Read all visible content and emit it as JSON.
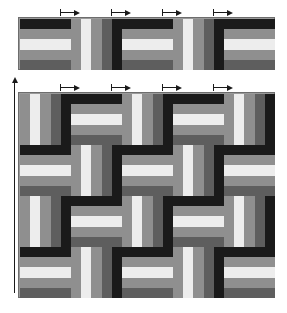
{
  "figure": {
    "background_color": "#ffffff"
  },
  "palette": {
    "black": "#1a1a1a",
    "dark_gray": "#5e5e5e",
    "medium_gray": "#8f8f8f",
    "light_gray": "#b9b9b9",
    "white": "#ededed",
    "outline": "#6d6d6d"
  },
  "block": {
    "stripe_count": 5,
    "stripe_colors": [
      "#1a1a1a",
      "#8f8f8f",
      "#ededed",
      "#8f8f8f",
      "#5e5e5e"
    ],
    "orientations": [
      "horizontal",
      "vertical"
    ],
    "size_px": 51
  },
  "top_band": {
    "label": "single row strip",
    "x": 18,
    "y": 17,
    "columns": 5,
    "rows": 1,
    "blocks": [
      {
        "orientation": "horizontal",
        "stripes": [
          "#1a1a1a",
          "#8f8f8f",
          "#ededed",
          "#8f8f8f",
          "#5e5e5e"
        ]
      },
      {
        "orientation": "vertical",
        "stripes": [
          "#8f8f8f",
          "#ededed",
          "#8f8f8f",
          "#5e5e5e",
          "#1a1a1a"
        ]
      },
      {
        "orientation": "horizontal",
        "stripes": [
          "#1a1a1a",
          "#8f8f8f",
          "#ededed",
          "#8f8f8f",
          "#5e5e5e"
        ]
      },
      {
        "orientation": "vertical",
        "stripes": [
          "#8f8f8f",
          "#ededed",
          "#8f8f8f",
          "#5e5e5e",
          "#1a1a1a"
        ]
      },
      {
        "orientation": "horizontal",
        "stripes": [
          "#1a1a1a",
          "#8f8f8f",
          "#ededed",
          "#8f8f8f",
          "#5e5e5e"
        ]
      }
    ],
    "arrows": [
      {
        "x": 60,
        "y": 9,
        "width": 20
      },
      {
        "x": 111,
        "y": 9,
        "width": 20
      },
      {
        "x": 162,
        "y": 9,
        "width": 20
      },
      {
        "x": 213,
        "y": 9,
        "width": 20
      }
    ]
  },
  "main_quilt": {
    "label": "assembled quilt top",
    "x": 18,
    "y": 92,
    "columns": 5,
    "rows": 4,
    "grid": [
      [
        "vertical",
        "horizontal",
        "vertical",
        "horizontal",
        "vertical"
      ],
      [
        "horizontal",
        "vertical",
        "horizontal",
        "vertical",
        "horizontal"
      ],
      [
        "vertical",
        "horizontal",
        "vertical",
        "horizontal",
        "vertical"
      ],
      [
        "horizontal",
        "vertical",
        "horizontal",
        "vertical",
        "horizontal"
      ]
    ],
    "horizontal_stripes": [
      "#1a1a1a",
      "#8f8f8f",
      "#ededed",
      "#8f8f8f",
      "#5e5e5e"
    ],
    "vertical_stripes": [
      "#8f8f8f",
      "#ededed",
      "#8f8f8f",
      "#5e5e5e",
      "#1a1a1a"
    ],
    "arrows": [
      {
        "x": 60,
        "y": 84,
        "width": 20
      },
      {
        "x": 111,
        "y": 84,
        "width": 20
      },
      {
        "x": 162,
        "y": 84,
        "width": 20
      },
      {
        "x": 213,
        "y": 84,
        "width": 20
      }
    ],
    "vertical_arrow": {
      "x": 11,
      "y": 77,
      "height": 216
    }
  }
}
